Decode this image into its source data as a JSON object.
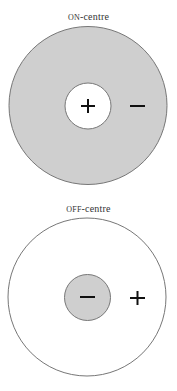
{
  "diagrams": [
    {
      "title_prefix": "ON",
      "title_suffix": "-centre",
      "outer_fill": "#cfcfcf",
      "inner_fill": "#ffffff",
      "center_sign": "+",
      "surround_sign": "−"
    },
    {
      "title_prefix": "OFF",
      "title_suffix": "-centre",
      "outer_fill": "#ffffff",
      "inner_fill": "#cfcfcf",
      "center_sign": "−",
      "surround_sign": "+"
    }
  ],
  "colors": {
    "outline": "#777777",
    "sign": "#111111"
  }
}
